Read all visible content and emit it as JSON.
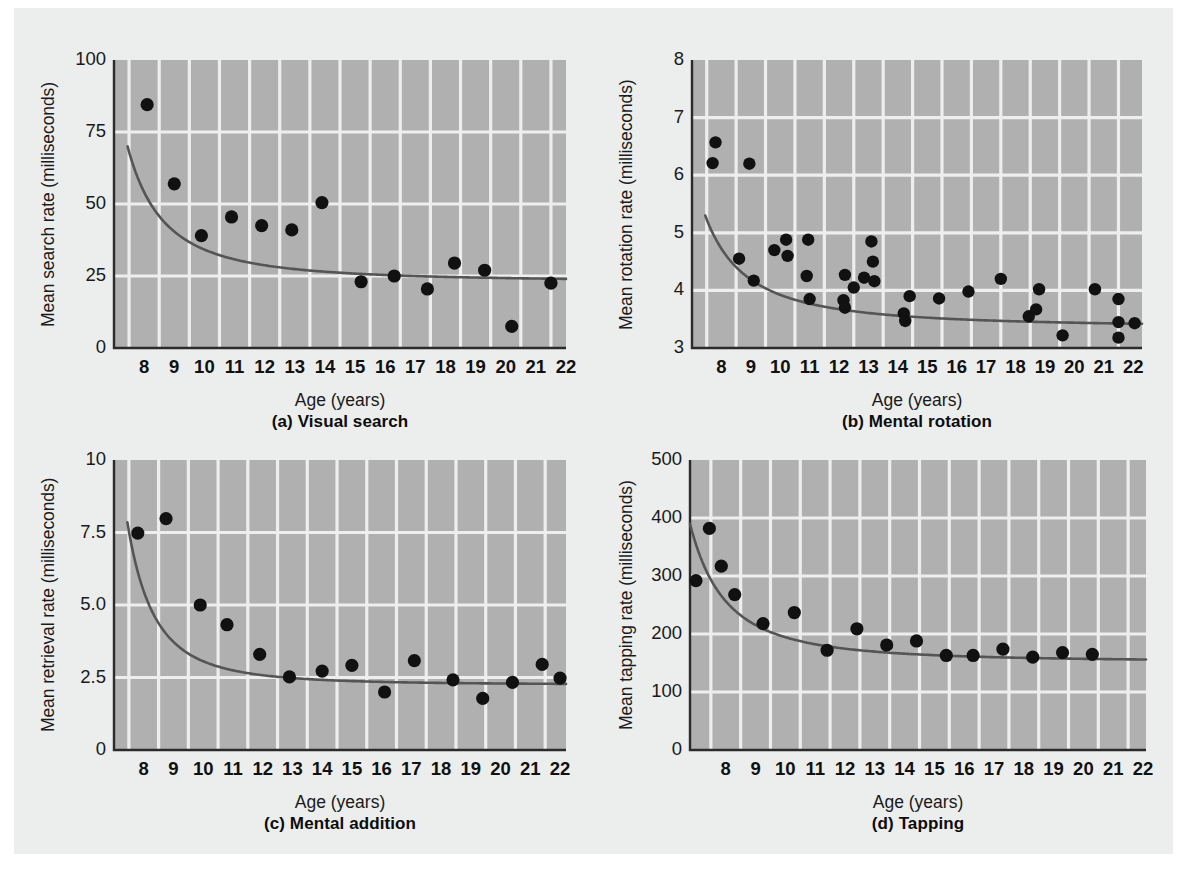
{
  "figure": {
    "background": "#eceded",
    "plot_area_fill": "#b0b0b0",
    "gridline_color": "#eeeeee",
    "point_color": "#111111",
    "curve_color": "#555555"
  },
  "panels": [
    {
      "id": "a",
      "caption": "(a) Visual search",
      "xlabel": "Age (years)",
      "ylabel": "Mean search rate (milliseconds)"
    },
    {
      "id": "b",
      "caption": "(b) Mental rotation",
      "xlabel": "Age (years)",
      "ylabel": "Mean rotation rate (milliseconds)"
    },
    {
      "id": "c",
      "caption": "(c) Mental addition",
      "xlabel": "Age (years)",
      "ylabel": "Mean retrieval rate (milliseconds)"
    },
    {
      "id": "d",
      "caption": "(d) Tapping",
      "xlabel": "Age (years)",
      "ylabel": "Mean tapping rate (milliseconds)"
    }
  ],
  "chart_data": [
    {
      "type": "scatter",
      "panel": "a",
      "title": "(a) Visual search",
      "xlabel": "Age (years)",
      "ylabel": "Mean search rate (milliseconds)",
      "xlim": [
        7.5,
        22.5
      ],
      "ylim": [
        0,
        100
      ],
      "xticks": [
        8,
        9,
        10,
        11,
        12,
        13,
        14,
        15,
        16,
        17,
        18,
        19,
        20,
        21,
        22
      ],
      "yticks": [
        0,
        25,
        50,
        75,
        100
      ],
      "grid": true,
      "legend": "none",
      "points": [
        {
          "x": 8.6,
          "y": 84.5
        },
        {
          "x": 9.5,
          "y": 57.0
        },
        {
          "x": 10.4,
          "y": 39.0
        },
        {
          "x": 11.4,
          "y": 45.5
        },
        {
          "x": 12.4,
          "y": 42.5
        },
        {
          "x": 13.4,
          "y": 41.0
        },
        {
          "x": 14.4,
          "y": 50.5
        },
        {
          "x": 15.7,
          "y": 23.0
        },
        {
          "x": 16.8,
          "y": 25.0
        },
        {
          "x": 17.9,
          "y": 20.5
        },
        {
          "x": 18.8,
          "y": 29.5
        },
        {
          "x": 19.8,
          "y": 27.0
        },
        {
          "x": 20.7,
          "y": 7.5
        },
        {
          "x": 22.0,
          "y": 22.5
        }
      ],
      "fit_curve": {
        "note": "decreasing power fit",
        "x_start": 7.95,
        "x_end": 22.5,
        "y_start": 70.0,
        "y_end": 24.0,
        "asymptote": 23.0
      }
    },
    {
      "type": "scatter",
      "panel": "b",
      "title": "(b) Mental rotation",
      "xlabel": "Age (years)",
      "ylabel": "Mean rotation rate (milliseconds)",
      "xlim": [
        7.5,
        22.8
      ],
      "ylim": [
        3,
        8
      ],
      "xticks": [
        8,
        9,
        10,
        11,
        12,
        13,
        14,
        15,
        16,
        17,
        18,
        19,
        20,
        21,
        22
      ],
      "yticks": [
        3,
        4,
        5,
        6,
        7,
        8
      ],
      "grid": true,
      "legend": "none",
      "points": [
        {
          "x": 8.3,
          "y": 6.57
        },
        {
          "x": 8.2,
          "y": 6.21
        },
        {
          "x": 9.1,
          "y": 4.55
        },
        {
          "x": 9.45,
          "y": 6.2
        },
        {
          "x": 9.6,
          "y": 4.17
        },
        {
          "x": 10.3,
          "y": 4.7
        },
        {
          "x": 10.7,
          "y": 4.88
        },
        {
          "x": 10.75,
          "y": 4.6
        },
        {
          "x": 11.45,
          "y": 4.88
        },
        {
          "x": 11.4,
          "y": 4.25
        },
        {
          "x": 11.5,
          "y": 3.85
        },
        {
          "x": 12.7,
          "y": 4.27
        },
        {
          "x": 12.65,
          "y": 3.83
        },
        {
          "x": 12.7,
          "y": 3.7
        },
        {
          "x": 13.0,
          "y": 4.05
        },
        {
          "x": 13.6,
          "y": 4.85
        },
        {
          "x": 13.65,
          "y": 4.5
        },
        {
          "x": 13.7,
          "y": 4.16
        },
        {
          "x": 13.35,
          "y": 4.22
        },
        {
          "x": 14.7,
          "y": 3.6
        },
        {
          "x": 14.75,
          "y": 3.47
        },
        {
          "x": 14.9,
          "y": 3.9
        },
        {
          "x": 15.9,
          "y": 3.86
        },
        {
          "x": 16.9,
          "y": 3.98
        },
        {
          "x": 18.0,
          "y": 4.2
        },
        {
          "x": 18.95,
          "y": 3.55
        },
        {
          "x": 19.2,
          "y": 3.67
        },
        {
          "x": 19.3,
          "y": 4.02
        },
        {
          "x": 20.1,
          "y": 3.22
        },
        {
          "x": 21.2,
          "y": 4.02
        },
        {
          "x": 22.0,
          "y": 3.85
        },
        {
          "x": 22.0,
          "y": 3.45
        },
        {
          "x": 22.0,
          "y": 3.18
        },
        {
          "x": 22.55,
          "y": 3.43
        }
      ],
      "fit_curve": {
        "note": "decreasing power fit",
        "x_start": 7.95,
        "x_end": 22.8,
        "y_start": 5.3,
        "y_end": 3.42,
        "asymptote": 3.35
      }
    },
    {
      "type": "scatter",
      "panel": "c",
      "title": "(c) Mental addition",
      "xlabel": "Age (years)",
      "ylabel": "Mean retrieval rate (milliseconds)",
      "xlim": [
        7.5,
        22.7
      ],
      "ylim": [
        0,
        10
      ],
      "xticks": [
        8,
        9,
        10,
        11,
        12,
        13,
        14,
        15,
        16,
        17,
        18,
        19,
        20,
        21,
        22
      ],
      "yticks": [
        0,
        2.5,
        5.0,
        7.5,
        10
      ],
      "grid": true,
      "legend": "none",
      "points": [
        {
          "x": 8.3,
          "y": 7.48
        },
        {
          "x": 9.25,
          "y": 7.98
        },
        {
          "x": 10.4,
          "y": 5.0
        },
        {
          "x": 11.3,
          "y": 4.32
        },
        {
          "x": 12.4,
          "y": 3.3
        },
        {
          "x": 13.4,
          "y": 2.52
        },
        {
          "x": 14.5,
          "y": 2.72
        },
        {
          "x": 15.5,
          "y": 2.92
        },
        {
          "x": 16.6,
          "y": 2.0
        },
        {
          "x": 17.6,
          "y": 3.08
        },
        {
          "x": 18.9,
          "y": 2.42
        },
        {
          "x": 19.9,
          "y": 1.78
        },
        {
          "x": 20.9,
          "y": 2.33
        },
        {
          "x": 21.9,
          "y": 2.95
        },
        {
          "x": 22.5,
          "y": 2.48
        }
      ],
      "fit_curve": {
        "note": "decreasing power fit",
        "x_start": 7.95,
        "x_end": 22.7,
        "y_start": 7.85,
        "y_end": 2.28,
        "asymptote": 2.25
      }
    },
    {
      "type": "scatter",
      "panel": "d",
      "title": "(d) Tapping",
      "xlabel": "Age (years)",
      "ylabel": "Mean tapping rate (milliseconds)",
      "xlim": [
        7.3,
        22.6
      ],
      "ylim": [
        0,
        500
      ],
      "xticks": [
        8,
        9,
        10,
        11,
        12,
        13,
        14,
        15,
        16,
        17,
        18,
        19,
        20,
        21,
        22
      ],
      "yticks": [
        0,
        100,
        200,
        300,
        400,
        500
      ],
      "grid": true,
      "legend": "none",
      "points": [
        {
          "x": 7.5,
          "y": 292
        },
        {
          "x": 7.95,
          "y": 382
        },
        {
          "x": 8.35,
          "y": 317
        },
        {
          "x": 8.8,
          "y": 268
        },
        {
          "x": 9.75,
          "y": 218
        },
        {
          "x": 10.8,
          "y": 237
        },
        {
          "x": 11.9,
          "y": 172
        },
        {
          "x": 12.9,
          "y": 209
        },
        {
          "x": 13.9,
          "y": 181
        },
        {
          "x": 14.9,
          "y": 188
        },
        {
          "x": 15.9,
          "y": 163
        },
        {
          "x": 16.8,
          "y": 163
        },
        {
          "x": 17.8,
          "y": 174
        },
        {
          "x": 18.8,
          "y": 160
        },
        {
          "x": 19.8,
          "y": 168
        },
        {
          "x": 20.8,
          "y": 165
        }
      ],
      "fit_curve": {
        "note": "decreasing power fit",
        "x_start": 7.3,
        "x_end": 22.6,
        "y_start": 390,
        "y_end": 156,
        "asymptote": 152
      }
    }
  ]
}
